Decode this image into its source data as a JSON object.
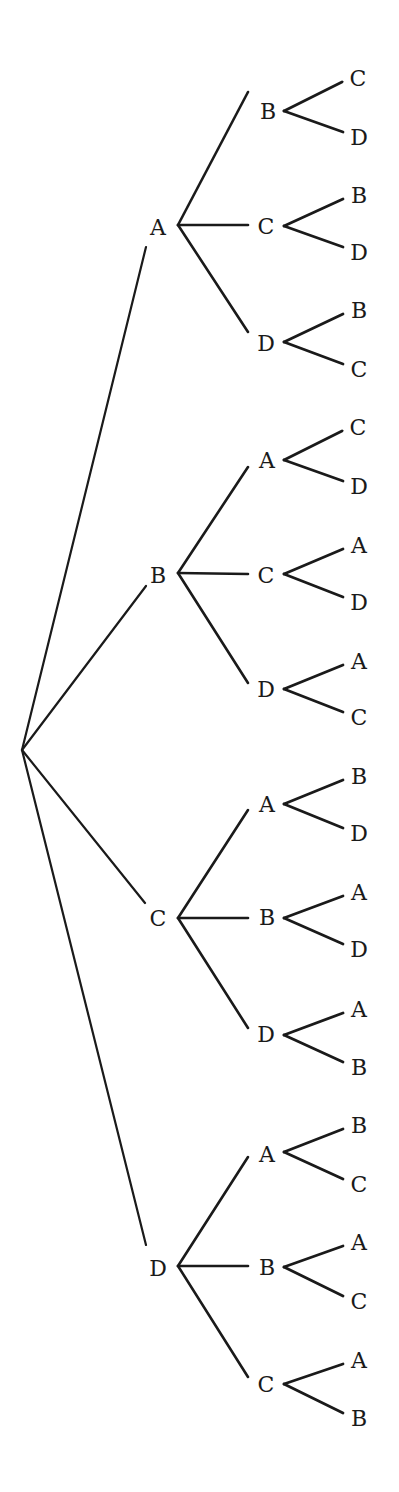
{
  "diagram": {
    "type": "tree",
    "title": "",
    "line_color": "#1a1a1a",
    "text_color": "#1a1a1a",
    "root": {
      "x": 22,
      "y": 750
    },
    "level1": [
      {
        "label": "A",
        "x": 158,
        "y": 228,
        "fork": {
          "x": 178,
          "y": 225
        },
        "stem_end": {
          "x": 146,
          "y": 247
        },
        "children": [
          {
            "label": "B",
            "x": 268,
            "y": 112,
            "fork": {
              "x": 284,
              "y": 111
            },
            "stem_end": {
              "x": 248,
              "y": 92
            },
            "leaves": [
              {
                "label": "C",
                "x": 358,
                "y": 79
              },
              {
                "label": "D",
                "x": 359,
                "y": 138
              }
            ]
          },
          {
            "label": "C",
            "x": 266,
            "y": 227,
            "fork": {
              "x": 284,
              "y": 226
            },
            "stem_end": {
              "x": 248,
              "y": 225
            },
            "leaves": [
              {
                "label": "B",
                "x": 359,
                "y": 196
              },
              {
                "label": "D",
                "x": 359,
                "y": 253
              }
            ]
          },
          {
            "label": "D",
            "x": 266,
            "y": 344,
            "fork": {
              "x": 284,
              "y": 342
            },
            "stem_end": {
              "x": 248,
              "y": 332
            },
            "leaves": [
              {
                "label": "B",
                "x": 359,
                "y": 311
              },
              {
                "label": "C",
                "x": 359,
                "y": 370
              }
            ]
          }
        ]
      },
      {
        "label": "B",
        "x": 158,
        "y": 576,
        "fork": {
          "x": 178,
          "y": 573
        },
        "stem_end": {
          "x": 146,
          "y": 586
        },
        "children": [
          {
            "label": "A",
            "x": 267,
            "y": 461,
            "fork": {
              "x": 284,
              "y": 460
            },
            "stem_end": {
              "x": 248,
              "y": 467
            },
            "leaves": [
              {
                "label": "C",
                "x": 358,
                "y": 428
              },
              {
                "label": "D",
                "x": 359,
                "y": 487
              }
            ]
          },
          {
            "label": "C",
            "x": 266,
            "y": 576,
            "fork": {
              "x": 284,
              "y": 574
            },
            "stem_end": {
              "x": 248,
              "y": 574
            },
            "leaves": [
              {
                "label": "A",
                "x": 359,
                "y": 546
              },
              {
                "label": "D",
                "x": 359,
                "y": 603
              }
            ]
          },
          {
            "label": "D",
            "x": 266,
            "y": 690,
            "fork": {
              "x": 284,
              "y": 689
            },
            "stem_end": {
              "x": 248,
              "y": 683
            },
            "leaves": [
              {
                "label": "A",
                "x": 359,
                "y": 662
              },
              {
                "label": "C",
                "x": 359,
                "y": 718
              }
            ]
          }
        ]
      },
      {
        "label": "C",
        "x": 158,
        "y": 919,
        "fork": {
          "x": 178,
          "y": 918
        },
        "stem_end": {
          "x": 145,
          "y": 903
        },
        "children": [
          {
            "label": "A",
            "x": 267,
            "y": 805,
            "fork": {
              "x": 284,
              "y": 804
            },
            "stem_end": {
              "x": 248,
              "y": 810
            },
            "leaves": [
              {
                "label": "B",
                "x": 359,
                "y": 777
              },
              {
                "label": "D",
                "x": 359,
                "y": 834
              }
            ]
          },
          {
            "label": "B",
            "x": 267,
            "y": 918,
            "fork": {
              "x": 284,
              "y": 918
            },
            "stem_end": {
              "x": 248,
              "y": 918
            },
            "leaves": [
              {
                "label": "A",
                "x": 359,
                "y": 893
              },
              {
                "label": "D",
                "x": 359,
                "y": 950
              }
            ]
          },
          {
            "label": "D",
            "x": 266,
            "y": 1035,
            "fork": {
              "x": 284,
              "y": 1035
            },
            "stem_end": {
              "x": 248,
              "y": 1028
            },
            "leaves": [
              {
                "label": "A",
                "x": 359,
                "y": 1010
              },
              {
                "label": "B",
                "x": 359,
                "y": 1068
              }
            ]
          }
        ]
      },
      {
        "label": "D",
        "x": 158,
        "y": 1269,
        "fork": {
          "x": 178,
          "y": 1266
        },
        "stem_end": {
          "x": 146,
          "y": 1245
        },
        "children": [
          {
            "label": "A",
            "x": 267,
            "y": 1155,
            "fork": {
              "x": 284,
              "y": 1152
            },
            "stem_end": {
              "x": 248,
              "y": 1157
            },
            "leaves": [
              {
                "label": "B",
                "x": 359,
                "y": 1126
              },
              {
                "label": "C",
                "x": 359,
                "y": 1185
              }
            ]
          },
          {
            "label": "B",
            "x": 267,
            "y": 1268,
            "fork": {
              "x": 284,
              "y": 1267
            },
            "stem_end": {
              "x": 248,
              "y": 1266
            },
            "leaves": [
              {
                "label": "A",
                "x": 359,
                "y": 1243
              },
              {
                "label": "C",
                "x": 359,
                "y": 1302
              }
            ]
          },
          {
            "label": "C",
            "x": 266,
            "y": 1385,
            "fork": {
              "x": 284,
              "y": 1384
            },
            "stem_end": {
              "x": 248,
              "y": 1377
            },
            "leaves": [
              {
                "label": "A",
                "x": 359,
                "y": 1361
              },
              {
                "label": "B",
                "x": 359,
                "y": 1419
              }
            ]
          }
        ]
      }
    ]
  }
}
